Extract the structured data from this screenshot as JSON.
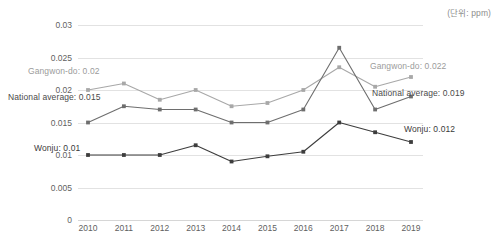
{
  "unit_note": "(단위: ppm)",
  "chart_data": {
    "type": "line",
    "title": "",
    "subtitle": "",
    "xlabel": "",
    "ylabel": "",
    "unit": "ppm",
    "grid": true,
    "legend_position": "inline-annotations",
    "categories": [
      "2010",
      "2011",
      "2012",
      "2013",
      "2014",
      "2015",
      "2016",
      "2017",
      "2018",
      "2019"
    ],
    "x": [
      2010,
      2011,
      2012,
      2013,
      2014,
      2015,
      2016,
      2017,
      2018,
      2019
    ],
    "ylim": [
      0,
      0.03
    ],
    "yticks": [
      "0",
      "0.005",
      "0.01",
      "0.015",
      "0.02",
      "0.025",
      "0.03"
    ],
    "ytick_values": [
      0,
      0.005,
      0.01,
      0.015,
      0.02,
      0.025,
      0.03
    ],
    "series": [
      {
        "name": "Gangwon-do",
        "color": "#a8a8a8",
        "values": [
          0.02,
          0.021,
          0.0185,
          0.02,
          0.0175,
          0.018,
          0.02,
          0.0235,
          0.0205,
          0.022
        ]
      },
      {
        "name": "National average",
        "color": "#6e6e6e",
        "values": [
          0.015,
          0.0175,
          0.017,
          0.017,
          0.015,
          0.015,
          0.017,
          0.0265,
          0.017,
          0.019
        ]
      },
      {
        "name": "Wonju",
        "color": "#3d3d3d",
        "values": [
          0.01,
          0.01,
          0.01,
          0.0115,
          0.009,
          0.0098,
          0.0105,
          0.015,
          0.0135,
          0.012
        ]
      }
    ],
    "annotations": [
      {
        "id": "gangwon_start",
        "text": "Gangwon-do: 0.02",
        "series": "Gangwon-do",
        "side": "left"
      },
      {
        "id": "national_start",
        "text": "National average: 0.015",
        "series": "National average",
        "side": "left"
      },
      {
        "id": "wonju_start",
        "text": "Wonju: 0.01",
        "series": "Wonju",
        "side": "left"
      },
      {
        "id": "gangwon_end",
        "text": "Gangwon-do: 0.022",
        "series": "Gangwon-do",
        "side": "right"
      },
      {
        "id": "national_end",
        "text": "National average: 0.019",
        "series": "National average",
        "side": "right"
      },
      {
        "id": "wonju_end",
        "text": "Wonju: 0.012",
        "series": "Wonju",
        "side": "right"
      }
    ]
  }
}
